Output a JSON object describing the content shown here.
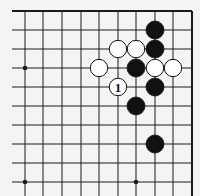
{
  "board": {
    "description": "Go board corner diagram (top-right region)",
    "columns_x": [
      25,
      43,
      62,
      81,
      99,
      118,
      136,
      155,
      173,
      192
    ],
    "rows_y": [
      11,
      30,
      49,
      68,
      87,
      106,
      125,
      144,
      163,
      182
    ],
    "edges": {
      "top": true,
      "right": true,
      "left": false,
      "bottom": false
    },
    "line_color": "#1a1a1a",
    "background": "#f4f4f2",
    "star_points": [
      {
        "col": 0,
        "row": 3
      },
      {
        "col": 0,
        "row": 9
      },
      {
        "col": 6,
        "row": 9
      }
    ],
    "stone_radius": 9,
    "black_stones": [
      {
        "col": 7,
        "row": 1
      },
      {
        "col": 7,
        "row": 2
      },
      {
        "col": 6,
        "row": 3
      },
      {
        "col": 7,
        "row": 4
      },
      {
        "col": 6,
        "row": 5
      },
      {
        "col": 7,
        "row": 7
      }
    ],
    "white_stones": [
      {
        "col": 5,
        "row": 2
      },
      {
        "col": 6,
        "row": 2
      },
      {
        "col": 4,
        "row": 3
      },
      {
        "col": 7,
        "row": 3
      },
      {
        "col": 8,
        "row": 3
      },
      {
        "col": 5,
        "row": 4,
        "label": "1"
      }
    ]
  }
}
